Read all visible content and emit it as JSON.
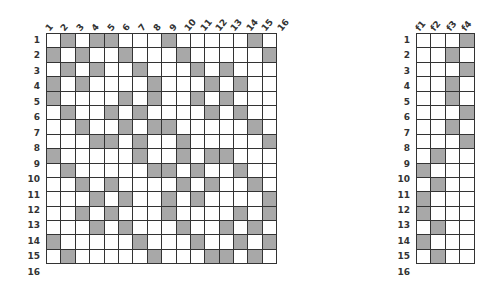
{
  "left_matrix": {
    "col_labels": [
      "1",
      "2",
      "3",
      "4",
      "5",
      "6",
      "7",
      "8",
      "9",
      "10",
      "11",
      "12",
      "13",
      "14",
      "15",
      "16"
    ],
    "row_labels": [
      "1",
      "2",
      "3",
      "4",
      "5",
      "6",
      "7",
      "8",
      "9",
      "10",
      "11",
      "12",
      "13",
      "14",
      "15",
      "16"
    ],
    "cells": [
      [
        0,
        1,
        0,
        1,
        1,
        0,
        0,
        0,
        1,
        0,
        0,
        0,
        0,
        0,
        1,
        0
      ],
      [
        1,
        0,
        1,
        0,
        0,
        1,
        0,
        0,
        0,
        1,
        0,
        0,
        0,
        0,
        0,
        1
      ],
      [
        0,
        1,
        0,
        1,
        0,
        0,
        1,
        0,
        0,
        0,
        1,
        0,
        1,
        0,
        0,
        0
      ],
      [
        1,
        0,
        1,
        0,
        0,
        0,
        0,
        1,
        0,
        0,
        0,
        1,
        0,
        1,
        0,
        0
      ],
      [
        1,
        0,
        0,
        0,
        0,
        1,
        0,
        1,
        0,
        0,
        1,
        0,
        1,
        0,
        0,
        0
      ],
      [
        0,
        1,
        0,
        0,
        1,
        0,
        1,
        0,
        0,
        0,
        0,
        1,
        0,
        1,
        0,
        0
      ],
      [
        0,
        0,
        1,
        0,
        0,
        1,
        0,
        1,
        1,
        0,
        0,
        0,
        0,
        0,
        1,
        0
      ],
      [
        0,
        0,
        0,
        1,
        1,
        0,
        1,
        0,
        0,
        1,
        0,
        0,
        0,
        0,
        0,
        1
      ],
      [
        1,
        0,
        0,
        0,
        0,
        0,
        1,
        0,
        0,
        1,
        0,
        1,
        1,
        0,
        0,
        0
      ],
      [
        0,
        1,
        0,
        0,
        0,
        0,
        0,
        1,
        1,
        0,
        1,
        0,
        0,
        1,
        0,
        0
      ],
      [
        0,
        0,
        1,
        0,
        1,
        0,
        0,
        0,
        0,
        1,
        0,
        1,
        0,
        0,
        1,
        0
      ],
      [
        0,
        0,
        0,
        1,
        0,
        1,
        0,
        0,
        1,
        0,
        1,
        0,
        0,
        0,
        0,
        1
      ],
      [
        0,
        0,
        1,
        0,
        1,
        0,
        0,
        0,
        1,
        0,
        0,
        0,
        0,
        1,
        0,
        1
      ],
      [
        0,
        0,
        0,
        1,
        0,
        1,
        0,
        0,
        0,
        1,
        0,
        0,
        1,
        0,
        1,
        0
      ],
      [
        1,
        0,
        0,
        0,
        0,
        0,
        1,
        0,
        0,
        0,
        1,
        0,
        0,
        1,
        0,
        1
      ],
      [
        0,
        1,
        0,
        0,
        0,
        0,
        0,
        1,
        0,
        0,
        0,
        1,
        1,
        0,
        1,
        0
      ]
    ]
  },
  "right_matrix": {
    "col_labels": [
      "f1",
      "f2",
      "f3",
      "f4"
    ],
    "row_labels": [
      "1",
      "2",
      "3",
      "4",
      "5",
      "6",
      "7",
      "8",
      "9",
      "10",
      "11",
      "12",
      "13",
      "14",
      "15",
      "16"
    ],
    "cells": [
      [
        0,
        0,
        0,
        1
      ],
      [
        0,
        0,
        1,
        0
      ],
      [
        0,
        0,
        0,
        1
      ],
      [
        0,
        0,
        1,
        0
      ],
      [
        0,
        0,
        1,
        0
      ],
      [
        0,
        0,
        0,
        1
      ],
      [
        0,
        0,
        1,
        0
      ],
      [
        0,
        0,
        0,
        1
      ],
      [
        0,
        1,
        0,
        0
      ],
      [
        1,
        0,
        0,
        0
      ],
      [
        0,
        1,
        0,
        0
      ],
      [
        1,
        0,
        0,
        0
      ],
      [
        1,
        0,
        0,
        0
      ],
      [
        0,
        1,
        0,
        0
      ],
      [
        1,
        0,
        0,
        0
      ],
      [
        0,
        1,
        0,
        0
      ]
    ]
  },
  "colors": {
    "filled": "#a8a8a8",
    "empty": "#ffffff",
    "border": "#333333"
  }
}
